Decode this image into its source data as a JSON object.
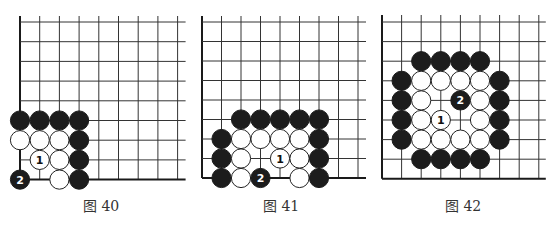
{
  "figures": [
    {
      "caption": "图 40",
      "board": {
        "origin_x": 20,
        "origin_y": 22,
        "spacing": 19.7,
        "cols": 9,
        "rows": 9,
        "line_ext_top": 6,
        "line_ext_right": 8,
        "stones": [
          {
            "col": 0,
            "row": 5,
            "color": "black"
          },
          {
            "col": 1,
            "row": 5,
            "color": "black"
          },
          {
            "col": 2,
            "row": 5,
            "color": "black"
          },
          {
            "col": 3,
            "row": 5,
            "color": "black"
          },
          {
            "col": 0,
            "row": 6,
            "color": "white"
          },
          {
            "col": 1,
            "row": 6,
            "color": "white"
          },
          {
            "col": 2,
            "row": 6,
            "color": "white"
          },
          {
            "col": 3,
            "row": 6,
            "color": "black"
          },
          {
            "col": 1,
            "row": 7,
            "color": "white",
            "label": "1"
          },
          {
            "col": 2,
            "row": 7,
            "color": "white"
          },
          {
            "col": 3,
            "row": 7,
            "color": "black"
          },
          {
            "col": 0,
            "row": 8,
            "color": "black",
            "label": "2"
          },
          {
            "col": 2,
            "row": 8,
            "color": "white"
          },
          {
            "col": 3,
            "row": 8,
            "color": "black"
          }
        ]
      }
    },
    {
      "caption": "图 41",
      "board": {
        "origin_x": 202,
        "origin_y": 22,
        "spacing": 19.5,
        "cols": 9,
        "rows": 9,
        "line_ext_top": 6,
        "line_ext_right": 8,
        "stones": [
          {
            "col": 2,
            "row": 5,
            "color": "black"
          },
          {
            "col": 3,
            "row": 5,
            "color": "black"
          },
          {
            "col": 4,
            "row": 5,
            "color": "black"
          },
          {
            "col": 5,
            "row": 5,
            "color": "black"
          },
          {
            "col": 6,
            "row": 5,
            "color": "black"
          },
          {
            "col": 1,
            "row": 6,
            "color": "black"
          },
          {
            "col": 2,
            "row": 6,
            "color": "white"
          },
          {
            "col": 3,
            "row": 6,
            "color": "white"
          },
          {
            "col": 4,
            "row": 6,
            "color": "white"
          },
          {
            "col": 5,
            "row": 6,
            "color": "white"
          },
          {
            "col": 6,
            "row": 6,
            "color": "black"
          },
          {
            "col": 1,
            "row": 7,
            "color": "black"
          },
          {
            "col": 2,
            "row": 7,
            "color": "white"
          },
          {
            "col": 4,
            "row": 7,
            "color": "white",
            "label": "1"
          },
          {
            "col": 5,
            "row": 7,
            "color": "white"
          },
          {
            "col": 6,
            "row": 7,
            "color": "black"
          },
          {
            "col": 1,
            "row": 8,
            "color": "black"
          },
          {
            "col": 2,
            "row": 8,
            "color": "white"
          },
          {
            "col": 3,
            "row": 8,
            "color": "black",
            "label": "2"
          },
          {
            "col": 5,
            "row": 8,
            "color": "white"
          },
          {
            "col": 6,
            "row": 8,
            "color": "black"
          }
        ]
      }
    },
    {
      "caption": "图 42",
      "board": {
        "origin_x": 382,
        "origin_y": 22,
        "spacing": 19.6,
        "cols": 9,
        "rows": 9,
        "line_ext_top": 7,
        "line_ext_right": 7,
        "stones": [
          {
            "col": 2,
            "row": 2,
            "color": "black"
          },
          {
            "col": 3,
            "row": 2,
            "color": "black"
          },
          {
            "col": 4,
            "row": 2,
            "color": "black"
          },
          {
            "col": 5,
            "row": 2,
            "color": "black"
          },
          {
            "col": 1,
            "row": 3,
            "color": "black"
          },
          {
            "col": 2,
            "row": 3,
            "color": "white"
          },
          {
            "col": 3,
            "row": 3,
            "color": "white"
          },
          {
            "col": 4,
            "row": 3,
            "color": "white"
          },
          {
            "col": 5,
            "row": 3,
            "color": "white"
          },
          {
            "col": 6,
            "row": 3,
            "color": "black"
          },
          {
            "col": 1,
            "row": 4,
            "color": "black"
          },
          {
            "col": 2,
            "row": 4,
            "color": "white"
          },
          {
            "col": 4,
            "row": 4,
            "color": "black",
            "label": "2"
          },
          {
            "col": 5,
            "row": 4,
            "color": "white"
          },
          {
            "col": 6,
            "row": 4,
            "color": "black"
          },
          {
            "col": 1,
            "row": 5,
            "color": "black"
          },
          {
            "col": 2,
            "row": 5,
            "color": "white"
          },
          {
            "col": 3,
            "row": 5,
            "color": "white",
            "label": "1"
          },
          {
            "col": 5,
            "row": 5,
            "color": "white"
          },
          {
            "col": 6,
            "row": 5,
            "color": "black"
          },
          {
            "col": 1,
            "row": 6,
            "color": "black"
          },
          {
            "col": 2,
            "row": 6,
            "color": "white"
          },
          {
            "col": 3,
            "row": 6,
            "color": "white"
          },
          {
            "col": 4,
            "row": 6,
            "color": "white"
          },
          {
            "col": 5,
            "row": 6,
            "color": "white"
          },
          {
            "col": 6,
            "row": 6,
            "color": "black"
          },
          {
            "col": 2,
            "row": 7,
            "color": "black"
          },
          {
            "col": 3,
            "row": 7,
            "color": "black"
          },
          {
            "col": 4,
            "row": 7,
            "color": "black"
          },
          {
            "col": 5,
            "row": 7,
            "color": "black"
          }
        ]
      }
    }
  ],
  "colors": {
    "grid": "#333333",
    "edge": "#1a1a1a",
    "black_stone": "#1c1c1c",
    "white_stone": "#ffffff",
    "white_stone_border": "#222222",
    "label_on_black": "#ffffff",
    "label_on_white": "#111111"
  }
}
